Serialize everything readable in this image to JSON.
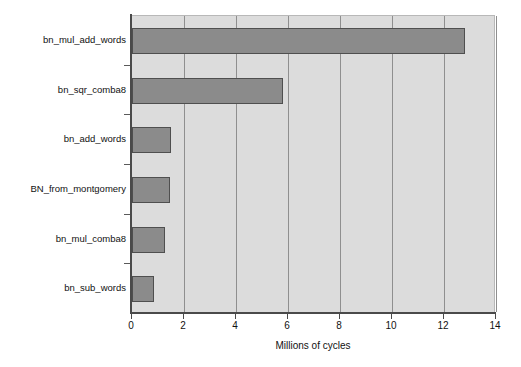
{
  "chart_data": {
    "type": "bar",
    "orientation": "horizontal",
    "title": "",
    "xlabel": "Millions of cycles",
    "ylabel": "",
    "xlim": [
      0,
      14
    ],
    "xticks": [
      0,
      2,
      4,
      6,
      8,
      10,
      12,
      14
    ],
    "xtick_labels": [
      "0",
      "2",
      "4",
      "6",
      "8",
      "10",
      "12",
      "14"
    ],
    "grid": "vertical",
    "legend": "none",
    "categories": [
      "bn_mul_add_words",
      "bn_sqr_comba8",
      "bn_add_words",
      "BN_from_montgomery",
      "bn_mul_comba8",
      "bn_sub_words"
    ],
    "values": [
      12.8,
      5.8,
      1.5,
      1.45,
      1.25,
      0.85
    ],
    "units": "millions of cycles",
    "colors": {
      "bar_fill": "#8b8b8b",
      "bar_edge": "#4f4f4f",
      "plot_background": "#dcdcdc",
      "gridline": "#8f8f8f",
      "axis": "#4a4a4a",
      "page_background": "#ffffff",
      "text": "#111111"
    }
  }
}
